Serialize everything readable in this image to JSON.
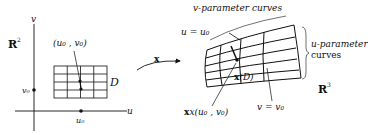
{
  "diagram": {
    "domain_panel": {
      "space_label": "R",
      "space_exp": "2",
      "axis_u": "u",
      "axis_v": "v",
      "point_label": "(u₀ , v₀)",
      "region_label": "D",
      "u0_label": "u₀",
      "v0_label": "v₀",
      "grid_rows": 4,
      "grid_cols": 4
    },
    "mapping": {
      "label": "x"
    },
    "surface_panel": {
      "space_label": "R",
      "space_exp": "3",
      "v_curves_label": "v-parameter curves",
      "u_curves_label_line1": "u-parameter",
      "u_curves_label_line2": "curves",
      "u_eq_label": "u = u₀",
      "v_eq_label": "v = v₀",
      "image_label": "x(D)",
      "point_image_label": "x(u₀ , v₀)"
    },
    "colors": {
      "ink": "#111111",
      "background": "#ffffff"
    }
  }
}
